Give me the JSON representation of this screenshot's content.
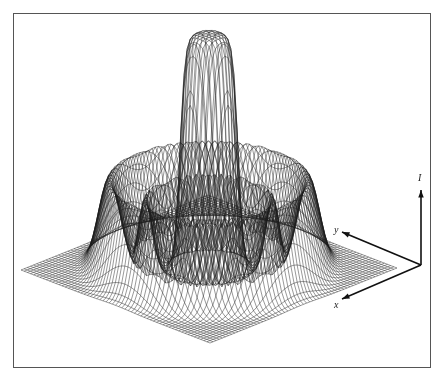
{
  "chart_data": {
    "type": "surface-wireframe",
    "title": "",
    "axes": {
      "x": {
        "label": "x",
        "origin": [
          421,
          265
        ],
        "tip": [
          342,
          299
        ],
        "label_pos": [
          334,
          299
        ]
      },
      "y": {
        "label": "y",
        "origin": [
          421,
          265
        ],
        "tip": [
          342,
          232
        ],
        "label_pos": [
          334,
          224
        ]
      },
      "I": {
        "label": "I",
        "origin": [
          421,
          265
        ],
        "tip": [
          421,
          190
        ],
        "label_pos": [
          418,
          172
        ]
      }
    },
    "ticks": "none visible",
    "grid": "wireframe mesh; no gridlines or numeric scale",
    "surface": {
      "note": "ESTIMATED from pixel geometry — no numeric scale is shown in the figure; the profile below is an approximation, not the true function",
      "domain": [
        [
          -1,
          1
        ],
        [
          -1,
          1
        ]
      ],
      "estimated_features": [
        {
          "feature": "central column",
          "radius_est": 0.22,
          "relative_height_est": 1.0
        },
        {
          "feature": "middle ring",
          "radius_est": 0.48,
          "relative_height_est": 0.3
        },
        {
          "feature": "outer ring",
          "radius_peak_est": 0.75,
          "outer_edge_est": 0.86,
          "relative_height_est": 0.38
        }
      ]
    },
    "projection": {
      "center": [
        209,
        269
      ],
      "ex": [
        -93.5,
        37.5
      ],
      "ey": [
        -94.5,
        -36.5
      ],
      "height_px": 234,
      "base_corners_px": {
        "left": [
          21,
          270
        ],
        "front": [
          210,
          343
        ],
        "right": [
          397,
          268
        ]
      }
    }
  }
}
